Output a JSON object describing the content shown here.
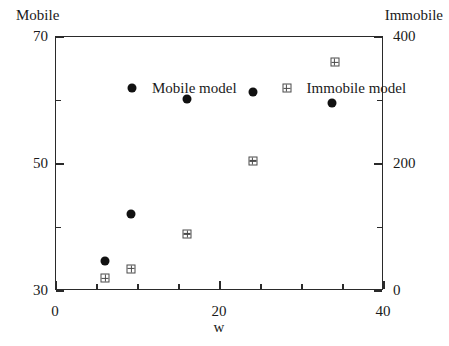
{
  "chart_data": {
    "type": "scatter",
    "title": "",
    "xlabel": "w",
    "ylabel": "Mobile",
    "y2label": "Immobile",
    "xlim": [
      0,
      40
    ],
    "ylim": [
      30,
      70
    ],
    "y2lim": [
      0,
      400
    ],
    "grid": false,
    "legend_position": "top-inside",
    "xticks": [
      "0",
      "20",
      "40"
    ],
    "xtick_values": [
      0,
      20,
      40
    ],
    "xminor_values": [
      5,
      10,
      15,
      25,
      30,
      35
    ],
    "yticks": [
      "30",
      "50",
      "70"
    ],
    "ytick_values": [
      30,
      50,
      70
    ],
    "yminor_values": [
      40,
      60
    ],
    "y2ticks": [
      "0",
      "200",
      "400"
    ],
    "y2tick_values": [
      0,
      200,
      400
    ],
    "y2minor_values": [
      100,
      300
    ],
    "series": [
      {
        "name": "Mobile model",
        "marker": "filled-circle",
        "axis": "left",
        "points": [
          {
            "x": 6.0,
            "y": 34.7
          },
          {
            "x": 9.2,
            "y": 42.2
          },
          {
            "x": 16.0,
            "y": 60.3
          },
          {
            "x": 24.0,
            "y": 61.3
          },
          {
            "x": 33.6,
            "y": 59.6
          }
        ]
      },
      {
        "name": "Immobile model",
        "marker": "crossed-square",
        "axis": "right",
        "points": [
          {
            "x": 6.0,
            "y": 20
          },
          {
            "x": 9.2,
            "y": 35
          },
          {
            "x": 16.0,
            "y": 90
          },
          {
            "x": 24.0,
            "y": 205
          },
          {
            "x": 34.0,
            "y": 360
          }
        ]
      }
    ]
  },
  "legend": {
    "mobile_label": "Mobile model",
    "immobile_label": "Immobile model"
  },
  "colors": {
    "mobile_marker": "#111111",
    "immobile_marker": "#4a4a4a",
    "axis": "#2a2a2a",
    "text": "#1a1a1a",
    "background": "#ffffff"
  }
}
